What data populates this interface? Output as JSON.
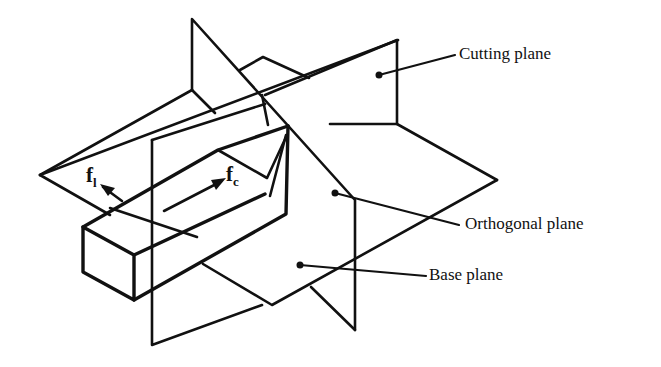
{
  "diagram": {
    "type": "line-drawing",
    "labels": {
      "cutting_plane": "Cutting plane",
      "orthogonal_plane": "Orthogonal plane",
      "base_plane": "Base plane"
    },
    "forces": {
      "feed": {
        "symbol": "f",
        "subscript": "l"
      },
      "cutting": {
        "symbol": "f",
        "subscript": "c"
      }
    },
    "colors": {
      "line": "#111111",
      "background": "#ffffff"
    }
  }
}
